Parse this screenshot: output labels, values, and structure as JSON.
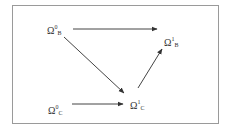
{
  "diagram": {
    "nodes": [
      {
        "id": "omega0B",
        "base": "Ω",
        "sup": "0",
        "sub": "B"
      },
      {
        "id": "omega1B",
        "base": "Ω",
        "sup": "1",
        "sub": "B"
      },
      {
        "id": "omega0C",
        "base": "Ω",
        "sup": "0",
        "sub": "C"
      },
      {
        "id": "omega1C",
        "base": "Ω",
        "sup": "1",
        "sub": "C"
      }
    ],
    "edges": [
      {
        "from": "omega0B",
        "to": "omega1B"
      },
      {
        "from": "omega0B",
        "to": "omega1C"
      },
      {
        "from": "omega0C",
        "to": "omega1C"
      },
      {
        "from": "omega1C",
        "to": "omega1B"
      }
    ],
    "colors": {
      "line": "#444444",
      "border": "#9a9a9a",
      "text": "#333333"
    }
  }
}
